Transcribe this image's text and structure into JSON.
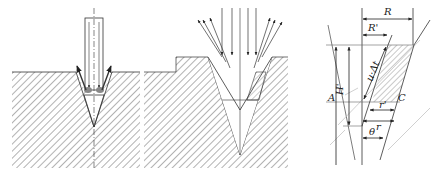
{
  "panels": [
    {
      "id": "panel-a",
      "description": "Single beam drilling conical hole with ejected melt"
    },
    {
      "id": "panel-b",
      "description": "Multiple beams reflected from deepening conical hole"
    },
    {
      "id": "panel-c",
      "description": "Geometry of hole wall removal"
    }
  ],
  "labels": {
    "R": "R",
    "R_prime": "R'",
    "H_prime": "H'",
    "A": "A",
    "C": "C",
    "u_delta_t": "u·Δt",
    "r_prime": "r'",
    "r": "r",
    "theta": "θ"
  },
  "colors": {
    "line": "#333333",
    "hatch": "#666666",
    "melt": "#777777",
    "background": "#ffffff"
  }
}
